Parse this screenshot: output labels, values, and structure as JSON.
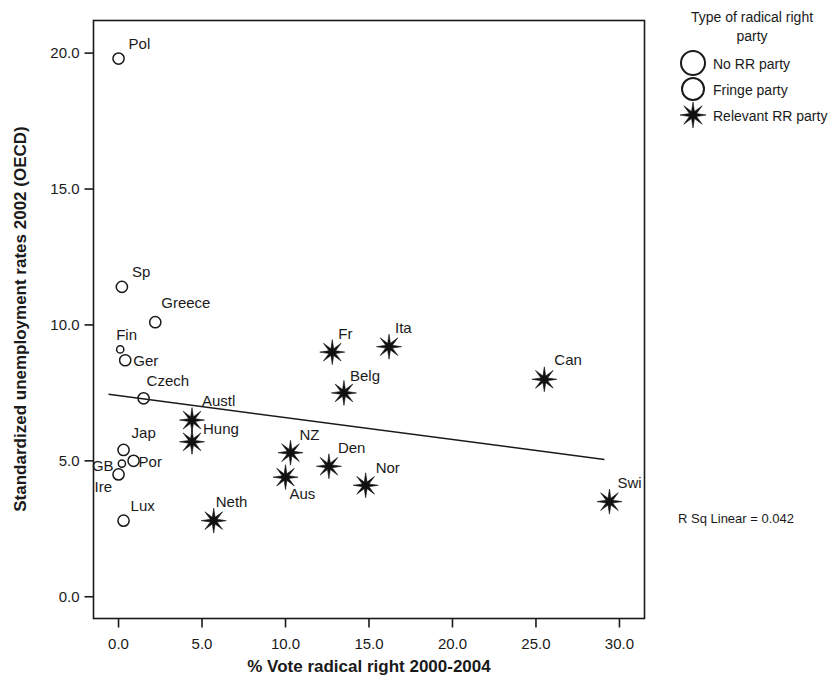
{
  "chart_data": {
    "type": "scatter",
    "title": "",
    "xlabel": "% Vote radical right 2000-2004",
    "ylabel": "Standardized unemployment rates 2002 (OECD)",
    "xlim": [
      -1.5,
      31.5
    ],
    "ylim": [
      -0.8,
      21.2
    ],
    "xticks": [
      "0.0",
      "5.0",
      "10.0",
      "15.0",
      "20.0",
      "25.0",
      "30.0"
    ],
    "xtick_values": [
      0,
      5,
      10,
      15,
      20,
      25,
      30
    ],
    "yticks": [
      "0.0",
      "5.0",
      "10.0",
      "15.0",
      "20.0"
    ],
    "ytick_values": [
      0,
      5,
      10,
      15,
      20
    ],
    "grid": false,
    "legend_position": "right",
    "annotation": "R Sq Linear = 0.042",
    "fit_line": {
      "type": "linear",
      "x_start": -0.6,
      "y_start": 7.45,
      "x_end": 29.1,
      "y_end": 5.05
    },
    "series": [
      {
        "name": "No RR party",
        "marker": "open-circle-large",
        "points": [
          {
            "label": "Pol",
            "x": 0.0,
            "y": 19.8,
            "label_dx": 10,
            "label_dy": -10
          },
          {
            "label": "Sp",
            "x": 0.2,
            "y": 11.4,
            "label_dx": 10,
            "label_dy": -10
          },
          {
            "label": "Greece",
            "x": 2.2,
            "y": 10.1,
            "label_dx": 6,
            "label_dy": -14
          },
          {
            "label": "Ger",
            "x": 0.4,
            "y": 8.7,
            "label_dx": 8,
            "label_dy": 6
          },
          {
            "label": "Czech",
            "x": 1.5,
            "y": 7.3,
            "label_dx": 3,
            "label_dy": -12
          },
          {
            "label": "Jap",
            "x": 0.3,
            "y": 5.4,
            "label_dx": 8,
            "label_dy": -12
          },
          {
            "label": "Por",
            "x": 0.9,
            "y": 5.0,
            "label_dx": 5,
            "label_dy": 6
          },
          {
            "label": "Ire",
            "x": 0.0,
            "y": 4.5,
            "label_dx": -24,
            "label_dy": 18
          },
          {
            "label": "Lux",
            "x": 0.3,
            "y": 2.8,
            "label_dx": 7,
            "label_dy": -10
          }
        ]
      },
      {
        "name": "Fringe party",
        "marker": "open-circle-small",
        "points": [
          {
            "label": "Fin",
            "x": 0.1,
            "y": 9.1,
            "label_dx": -4,
            "label_dy": -9
          },
          {
            "label": "GB",
            "x": 0.2,
            "y": 4.9,
            "label_dx": -30,
            "label_dy": 7
          }
        ]
      },
      {
        "name": "Relevant RR party",
        "marker": "star",
        "points": [
          {
            "label": "Fr",
            "x": 12.8,
            "y": 9.0,
            "label_dx": 6,
            "label_dy": -13
          },
          {
            "label": "Ita",
            "x": 16.2,
            "y": 9.2,
            "label_dx": 6,
            "label_dy": -14
          },
          {
            "label": "Belg",
            "x": 13.5,
            "y": 7.5,
            "label_dx": 6,
            "label_dy": -12
          },
          {
            "label": "Can",
            "x": 25.5,
            "y": 8.0,
            "label_dx": 10,
            "label_dy": -14
          },
          {
            "label": "Austl",
            "x": 4.4,
            "y": 6.5,
            "label_dx": 10,
            "label_dy": -14
          },
          {
            "label": "Hung",
            "x": 4.4,
            "y": 5.7,
            "label_dx": 11,
            "label_dy": -8
          },
          {
            "label": "NZ",
            "x": 10.3,
            "y": 5.3,
            "label_dx": 9,
            "label_dy": -13
          },
          {
            "label": "Den",
            "x": 12.6,
            "y": 4.8,
            "label_dx": 9,
            "label_dy": -13
          },
          {
            "label": "Aus",
            "x": 10.0,
            "y": 4.4,
            "label_dx": 4,
            "label_dy": 22
          },
          {
            "label": "Nor",
            "x": 14.8,
            "y": 4.1,
            "label_dx": 10,
            "label_dy": -12
          },
          {
            "label": "Neth",
            "x": 5.7,
            "y": 2.8,
            "label_dx": 2,
            "label_dy": -14
          },
          {
            "label": "Swi",
            "x": 29.4,
            "y": 3.5,
            "label_dx": 8,
            "label_dy": -14
          }
        ]
      }
    ]
  },
  "legend": {
    "title_line1": "Type of radical right",
    "title_line2": "party",
    "items": [
      {
        "label": "No RR party",
        "marker": "open-circle-large"
      },
      {
        "label": "Fringe party",
        "marker": "open-circle-medium"
      },
      {
        "label": "Relevant RR party",
        "marker": "star"
      }
    ]
  },
  "annotation": {
    "rsq": "R Sq Linear = 0.042"
  },
  "colors": {
    "ink": "#1a1a1a",
    "marker": "#111111",
    "background": "#ffffff"
  }
}
